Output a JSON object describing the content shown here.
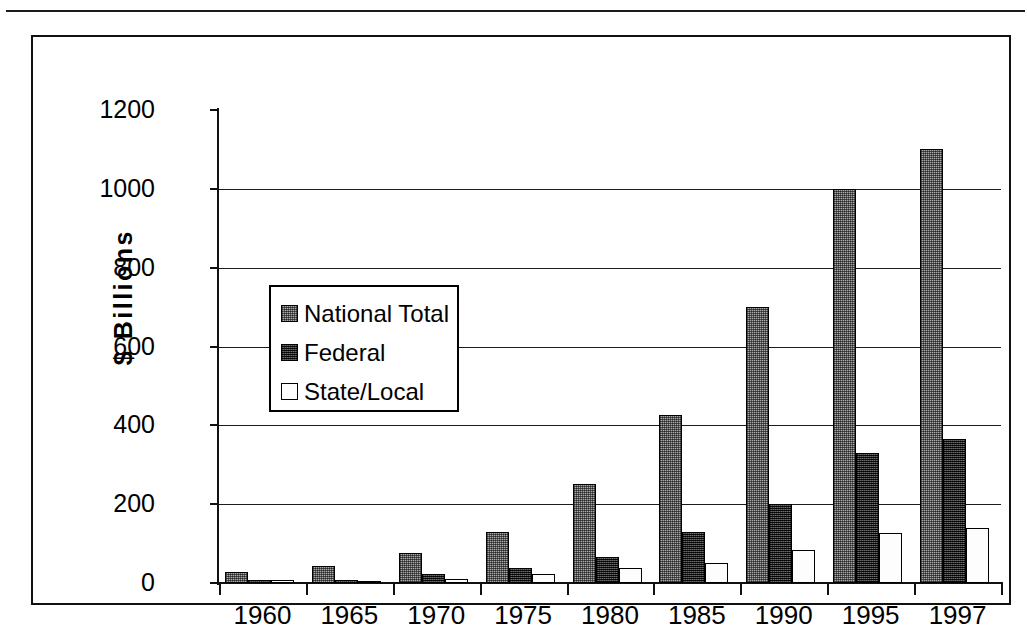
{
  "figure": {
    "frame": true,
    "top_rule": true
  },
  "axes": {
    "y_axis_title": "$ Billions",
    "y_ticks": [
      "0",
      "200",
      "400",
      "600",
      "800",
      "1000",
      "1200"
    ],
    "x_ticks": [
      "1960",
      "1965",
      "1970",
      "1975",
      "1980",
      "1985",
      "1990",
      "1995",
      "1997"
    ]
  },
  "legend": {
    "items": [
      {
        "label": "National Total",
        "swatch": "grey-dither-swatch"
      },
      {
        "label": "Federal",
        "swatch": "dark-dither-swatch"
      },
      {
        "label": "State/Local",
        "swatch": "white-swatch"
      }
    ]
  },
  "colors": {
    "national_total": "#a9a9a9",
    "federal": "#2b2b2b",
    "state_local": "#fdfdfd",
    "axis": "#111111",
    "gridline": "#1c1c1c"
  },
  "chart_data": {
    "type": "bar",
    "title": "",
    "subtitle": "",
    "xlabel": "",
    "ylabel": "$ Billions",
    "ylim": [
      0,
      1200
    ],
    "ytick_step": 200,
    "grid": true,
    "grid_axis": "y",
    "legend_position": "inside-upper-left",
    "bar_grouping": "grouped",
    "categories": [
      "1960",
      "1965",
      "1970",
      "1975",
      "1980",
      "1985",
      "1990",
      "1995",
      "1997"
    ],
    "series": [
      {
        "name": "National Total",
        "values": [
          27,
          42,
          75,
          130,
          250,
          425,
          700,
          1000,
          1100
        ]
      },
      {
        "name": "Federal",
        "values": [
          7,
          7,
          22,
          37,
          67,
          130,
          200,
          330,
          365
        ]
      },
      {
        "name": "State/Local",
        "values": [
          7,
          6,
          10,
          22,
          37,
          50,
          85,
          128,
          140
        ]
      }
    ]
  }
}
